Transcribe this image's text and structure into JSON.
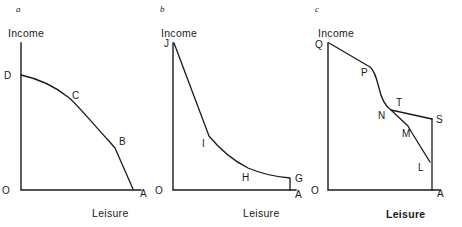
{
  "figure": {
    "title": "",
    "panels": [
      {
        "id": "a",
        "letter": "a",
        "y_axis_label": "Income",
        "x_axis_label": "Leisure",
        "x_axis_label_bold": false,
        "origin_label": "O",
        "points": [
          {
            "label": "D",
            "x": 13,
            "y": 71
          },
          {
            "label": "C",
            "x": 75,
            "y": 99
          },
          {
            "label": "B",
            "x": 119,
            "y": 142
          },
          {
            "label": "A",
            "x": 139,
            "y": 193
          }
        ],
        "axes": {
          "x0": 21,
          "y0": 190,
          "x1": 140,
          "ytop": 33
        },
        "curve": "M 21,75 C 44,80 58,89 68,97 C 76,103 94,125 108,140 L 115,148 L 133,189",
        "labels": [
          {
            "text": "D",
            "x": 6,
            "y": 79
          },
          {
            "text": "C",
            "x": 74,
            "y": 99
          },
          {
            "text": "B",
            "x": 119,
            "y": 144
          },
          {
            "text": "A",
            "x": 140,
            "y": 197
          }
        ]
      },
      {
        "id": "b",
        "letter": "b",
        "y_axis_label": "Income",
        "x_axis_label": "Leisure",
        "x_axis_label_bold": false,
        "origin_label": "O",
        "points": [
          {
            "label": "J",
            "x": 166,
            "y": 46
          },
          {
            "label": "I",
            "x": 206,
            "y": 142
          },
          {
            "label": "H",
            "x": 248,
            "y": 176
          },
          {
            "label": "G",
            "x": 293,
            "y": 178
          },
          {
            "label": "A",
            "x": 293,
            "y": 196
          }
        ],
        "axes": {
          "x0": 173,
          "y0": 190,
          "x1": 295,
          "ytop": 33
        },
        "curve": "M 174,43 L 209,136 C 218,147 232,160 248,168 C 262,174 278,177 290,178 L 290,190",
        "labels": [
          {
            "text": "J",
            "x": 163,
            "y": 47
          },
          {
            "text": "I",
            "x": 203,
            "y": 146
          },
          {
            "text": "H",
            "x": 244,
            "y": 180
          },
          {
            "text": "G",
            "x": 295,
            "y": 182
          },
          {
            "text": "A",
            "x": 295,
            "y": 198
          }
        ]
      },
      {
        "id": "c",
        "letter": "c",
        "y_axis_label": "Income",
        "x_axis_label": "Leisure",
        "x_axis_label_bold": true,
        "origin_label": "O",
        "points": [
          {
            "label": "Q",
            "x": 322,
            "y": 46
          },
          {
            "label": "P",
            "x": 367,
            "y": 71
          },
          {
            "label": "N",
            "x": 384,
            "y": 110
          },
          {
            "label": "T",
            "x": 397,
            "y": 105
          },
          {
            "label": "M",
            "x": 408,
            "y": 130
          },
          {
            "label": "S",
            "x": 434,
            "y": 120
          },
          {
            "label": "L",
            "x": 420,
            "y": 165
          },
          {
            "label": "A",
            "x": 436,
            "y": 196
          }
        ],
        "axes": {
          "x0": 328,
          "y0": 190,
          "x1": 438,
          "ytop": 33
        },
        "curve_main": "M 329,43 L 370,67 C 374,70 376,76 379,88 C 381,97 385,106 391,110 L 432,119",
        "curve_branch": "M 391,110 L 408,126 L 412,133 L 430,162",
        "curve_right": "M 432,119 L 432,162 L 432,190",
        "labels": [
          {
            "text": "Q",
            "x": 317,
            "y": 48
          },
          {
            "text": "P",
            "x": 362,
            "y": 75
          },
          {
            "text": "N",
            "x": 380,
            "y": 118
          },
          {
            "text": "T",
            "x": 397,
            "y": 106
          },
          {
            "text": "M",
            "x": 404,
            "y": 136
          },
          {
            "text": "S",
            "x": 436,
            "y": 122
          },
          {
            "text": "L",
            "x": 420,
            "y": 170
          },
          {
            "text": "A",
            "x": 437,
            "y": 197
          }
        ]
      }
    ]
  }
}
